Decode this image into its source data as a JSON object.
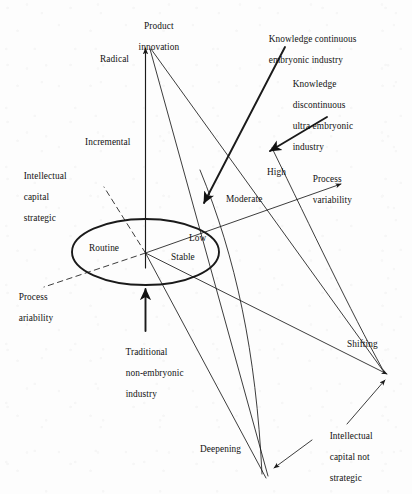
{
  "figure": {
    "type": "conceptual-diagram",
    "background_color": "#fdfdfd",
    "ink_color": "#1a1a1a",
    "width": 412,
    "height": 494
  },
  "axes": {
    "vertical": {
      "name": "product-innovation-axis",
      "title_line1": "Product",
      "title_line2": "innovation",
      "ticks": [
        "Radical",
        "Incremental"
      ]
    },
    "right": {
      "name": "process-variability-axis",
      "title_line1": "Process",
      "title_line2": "variability",
      "ticks": [
        "High",
        "Moderate",
        "Low"
      ]
    },
    "left_dashed": {
      "name": "process-variability-dashed-axis",
      "title_line1": "Process",
      "title_line2": "ariability",
      "ticks": [
        "Routine"
      ]
    },
    "left_upper_dashed": {
      "name": "intellectual-capital-strategic-axis",
      "title_line1": "Intellectual",
      "title_line2": "capital",
      "title_line3": "strategic"
    },
    "lower_right": {
      "name": "intellectual-capital-not-strategic-axis",
      "title_line1": "Intellectual",
      "title_line2": "capital not",
      "title_line3": "strategic",
      "ticks": [
        "Shifting",
        "Deepening",
        "Stable"
      ]
    }
  },
  "core": {
    "name": "core-ellipse",
    "labels": {
      "routine": "Routine",
      "low": "Low",
      "stable": "Stable"
    }
  },
  "callouts": [
    {
      "id": "knowledge-continuous",
      "line1": "Knowledge continuous",
      "line2": "embryonic industry",
      "line3": "",
      "line4": ""
    },
    {
      "id": "knowledge-discontinuous",
      "line1": "Knowledge",
      "line2": "discontinuous",
      "line3": "ultra embryonic",
      "line4": "industry"
    },
    {
      "id": "traditional-non-embryonic",
      "line1": "Traditional",
      "line2": "non-embryonic",
      "line3": "industry",
      "line4": ""
    }
  ],
  "tick_labels": {
    "radical": "Radical",
    "incremental": "Incremental",
    "high": "High",
    "moderate": "Moderate",
    "shifting": "Shifting",
    "deepening": "Deepening"
  }
}
